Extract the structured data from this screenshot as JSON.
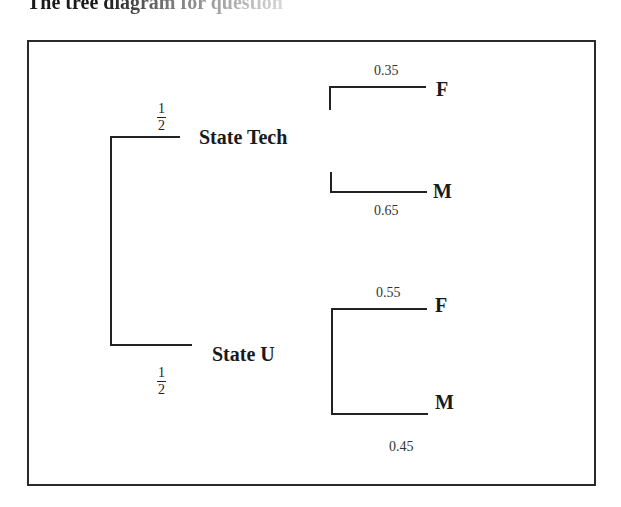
{
  "title": "The tree diagram for question",
  "diagram": {
    "root_branches": [
      {
        "node": "State Tech",
        "probability": {
          "numerator": "1",
          "denominator": "2"
        },
        "children": [
          {
            "label": "F",
            "probability": "0.35"
          },
          {
            "label": "M",
            "probability": "0.65"
          }
        ]
      },
      {
        "node": "State U",
        "probability": {
          "numerator": "1",
          "denominator": "2"
        },
        "children": [
          {
            "label": "F",
            "probability": "0.55"
          },
          {
            "label": "M",
            "probability": "0.45"
          }
        ]
      }
    ]
  }
}
